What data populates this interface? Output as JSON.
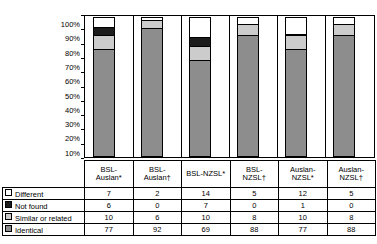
{
  "chart_data": {
    "type": "bar",
    "subtype": "stacked-100-percent-column",
    "title": "",
    "xlabel": "",
    "ylabel": "",
    "ylim": [
      0,
      100
    ],
    "ytick_labels": [
      "100%",
      "90%",
      "80%",
      "70%",
      "60%",
      "50%",
      "40%",
      "30%",
      "20%",
      "10%",
      "0%"
    ],
    "ytick_values": [
      100,
      90,
      80,
      70,
      60,
      50,
      40,
      30,
      20,
      10,
      0
    ],
    "grid": false,
    "legend_position": "table-left-column",
    "categories": [
      "BSL-Auslan*",
      "BSL-Auslan†",
      "BSL-NZSL*",
      "BSL-NZSL†",
      "Auslan-NZSL*",
      "Auslan-NZSL†"
    ],
    "category_lines": [
      [
        "BSL-",
        "Auslan*"
      ],
      [
        "BSL-",
        "Auslan†"
      ],
      [
        "BSL-NZSL*"
      ],
      [
        "BSL-",
        "NZSL†"
      ],
      [
        "Auslan-",
        "NZSL*"
      ],
      [
        "Auslan-",
        "NZSL†"
      ]
    ],
    "series": [
      {
        "name": "Different",
        "color": "#ffffff",
        "values": [
          7,
          2,
          14,
          5,
          12,
          5
        ]
      },
      {
        "name": "Not found",
        "color": "#1c1c1c",
        "values": [
          6,
          0,
          7,
          0,
          1,
          0
        ]
      },
      {
        "name": "Similar or related",
        "color": "#cccccc",
        "values": [
          10,
          6,
          10,
          8,
          10,
          8
        ]
      },
      {
        "name": "Identical",
        "color": "#8d8d8d",
        "values": [
          77,
          92,
          69,
          88,
          77,
          88
        ]
      }
    ],
    "stack_order_bottom_to_top": [
      "Identical",
      "Similar or related",
      "Not found",
      "Different"
    ]
  },
  "table": {
    "rows": [
      {
        "label": "Different",
        "swatch": "sw-different",
        "icon": "legend-swatch-different-icon",
        "values": [
          7,
          2,
          14,
          5,
          12,
          5
        ]
      },
      {
        "label": "Not found",
        "swatch": "sw-notfound",
        "icon": "legend-swatch-not-found-icon",
        "values": [
          6,
          0,
          7,
          0,
          1,
          0
        ]
      },
      {
        "label": "Similar or related",
        "swatch": "sw-similar",
        "icon": "legend-swatch-similar-icon",
        "values": [
          10,
          6,
          10,
          8,
          10,
          8
        ]
      },
      {
        "label": "Identical",
        "swatch": "sw-identical",
        "icon": "legend-swatch-identical-icon",
        "values": [
          77,
          92,
          69,
          88,
          77,
          88
        ]
      }
    ]
  }
}
